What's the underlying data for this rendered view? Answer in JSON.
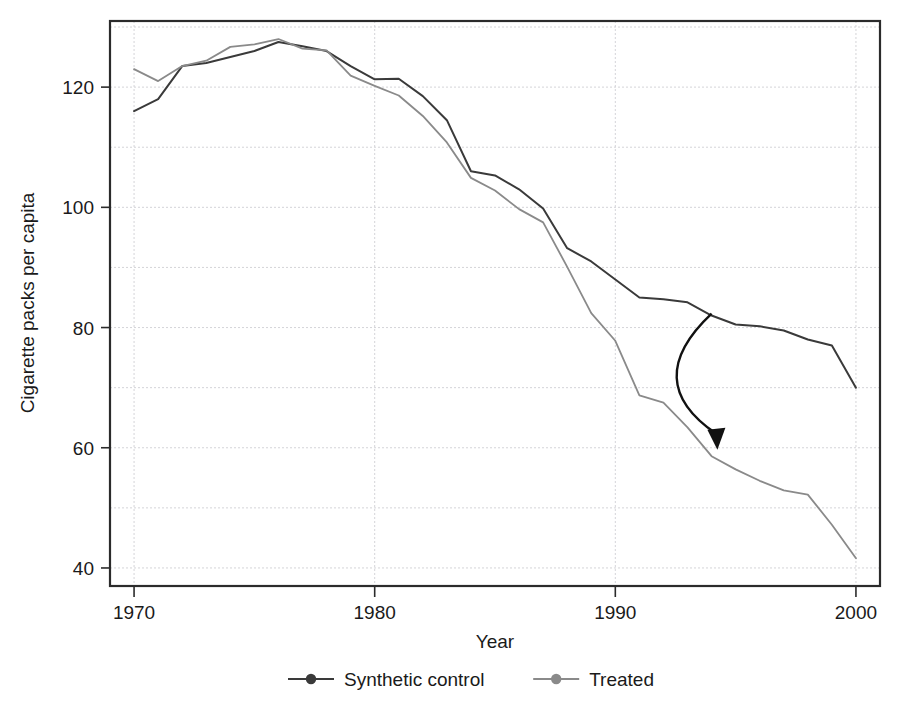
{
  "chart_data": {
    "type": "line",
    "title": "",
    "xlabel": "Year",
    "ylabel": "Cigarette packs per capita",
    "xlim": [
      1969,
      2001
    ],
    "ylim": [
      37,
      131
    ],
    "grid": true,
    "legend_position": "bottom",
    "xticks": [
      1970,
      1980,
      1990,
      2000
    ],
    "xtick_labels": [
      "1970",
      "1980",
      "1990",
      "2000"
    ],
    "yticks": [
      40,
      60,
      80,
      100,
      120
    ],
    "ytick_labels": [
      "40",
      "60",
      "80",
      "100",
      "120"
    ],
    "y_gridlines": [
      40,
      50,
      60,
      70,
      80,
      90,
      100,
      110,
      120,
      130
    ],
    "x_gridlines": [
      1970,
      1980,
      1990,
      2000
    ],
    "x": [
      1970,
      1971,
      1972,
      1973,
      1974,
      1975,
      1976,
      1977,
      1978,
      1979,
      1980,
      1981,
      1982,
      1983,
      1984,
      1985,
      1986,
      1987,
      1988,
      1989,
      1990,
      1991,
      1992,
      1993,
      1994,
      1995,
      1996,
      1997,
      1998,
      1999,
      2000
    ],
    "series": [
      {
        "name": "Synthetic control",
        "color": "#3a3a3a",
        "width": 2.0,
        "marker": "circle",
        "values": [
          116.0,
          118.0,
          123.5,
          124.0,
          125.0,
          126.0,
          127.5,
          126.8,
          126.0,
          123.5,
          121.3,
          121.4,
          118.5,
          114.5,
          106.0,
          105.3,
          103.0,
          99.8,
          93.2,
          91.0,
          88.0,
          85.0,
          84.7,
          84.2,
          82.0,
          80.5,
          80.2,
          79.5,
          78.0,
          77.0,
          70.0
        ]
      },
      {
        "name": "Treated",
        "color": "#8a8a8a",
        "width": 1.8,
        "marker": "circle",
        "values": [
          123.0,
          121.0,
          123.5,
          124.4,
          126.7,
          127.1,
          128.0,
          126.4,
          126.1,
          121.9,
          120.2,
          118.6,
          115.2,
          110.8,
          104.9,
          102.8,
          99.7,
          97.5,
          90.1,
          82.4,
          77.8,
          68.7,
          67.5,
          63.4,
          58.6,
          56.4,
          54.5,
          52.9,
          52.2,
          47.2,
          41.6
        ]
      }
    ],
    "annotations": [
      {
        "type": "curved-arrow",
        "from": {
          "x": 1994.0,
          "y": 82.3
        },
        "to": {
          "x": 1994.2,
          "y": 60.0
        },
        "control": {
          "x": 1991.0,
          "y": 71.0
        },
        "color": "#111111"
      }
    ]
  },
  "legend": {
    "items": [
      {
        "label": "Synthetic control",
        "color": "#3a3a3a"
      },
      {
        "label": "Treated",
        "color": "#8a8a8a"
      }
    ]
  },
  "axes": {
    "x_title": "Year",
    "y_title": "Cigarette packs per capita"
  }
}
